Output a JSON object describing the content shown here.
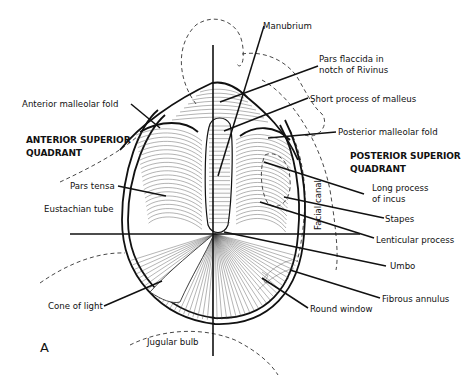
{
  "figure": {
    "panel_letter": "A"
  },
  "quadrant_labels": {
    "anterior_superior": [
      "ANTERIOR SUPERIOR",
      "QUADRANT"
    ],
    "posterior_superior": [
      "POSTERIOR SUPERIOR",
      "QUADRANT"
    ]
  },
  "labels": {
    "manubrium": "Manubrium",
    "pars_flaccida": [
      "Pars flaccida in",
      "notch of Rivinus"
    ],
    "short_process": "Short process of malleus",
    "posterior_malleolar_fold": "Posterior malleolar fold",
    "anterior_malleolar_fold": "Anterior malleolar fold",
    "pars_tensa": "Pars tensa",
    "eustachian_tube": "Eustachian tube",
    "facial_canal": "Facial canal",
    "long_process_incus": [
      "Long process",
      "of incus"
    ],
    "stapes": "Stapes",
    "lenticular_process": "Lenticular process",
    "umbo": "Umbo",
    "fibrous_annulus": "Fibrous annulus",
    "round_window": "Round window",
    "cone_of_light": "Cone of light",
    "jugular_bulb": "Jugular bulb"
  }
}
